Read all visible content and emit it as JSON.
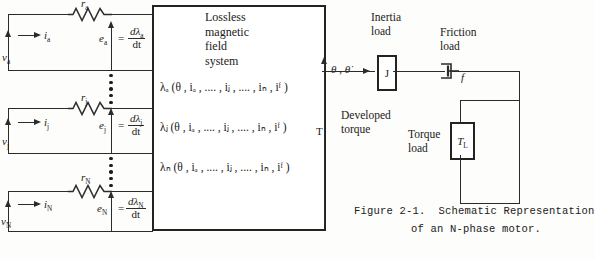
{
  "figure": {
    "caption_line1": "Figure 2-1.  Schematic Representation",
    "caption_line2": "of an N-phase motor."
  },
  "main_block": {
    "title_lines": [
      "Lossless",
      "magnetic",
      "field",
      "system"
    ],
    "equations": [
      "λₐ (θ , iₐ , .... , iⱼ , .... , iₙ , iᶠ )",
      "λⱼ (θ , iₐ , .... , iⱼ , .... , iₙ , iᶠ )",
      "λₙ (θ , iₐ , .... , iⱼ , .... , iₙ , iᶠ )"
    ]
  },
  "phases": [
    {
      "id": "a",
      "resistor_label": "r",
      "resistor_sub": "a",
      "current_label": "i",
      "current_sub": "a",
      "voltage_label": "v",
      "voltage_sub": "a",
      "emf_label": "e",
      "emf_sub": "a",
      "equals": "=",
      "numerator": "dλ",
      "numerator_sub": "a",
      "denominator": "dt"
    },
    {
      "id": "j",
      "resistor_label": "r",
      "resistor_sub": "j",
      "current_label": "i",
      "current_sub": "j",
      "voltage_label": "v",
      "voltage_sub": "j",
      "emf_label": "e",
      "emf_sub": "j",
      "equals": "=",
      "numerator": "dλ",
      "numerator_sub": "j",
      "denominator": "dt"
    },
    {
      "id": "N",
      "resistor_label": "r",
      "resistor_sub": "N",
      "current_label": "i",
      "current_sub": "N",
      "voltage_label": "v",
      "voltage_sub": "N",
      "emf_label": "e",
      "emf_sub": "N",
      "equals": "=",
      "numerator": "dλ",
      "numerator_sub": "N",
      "denominator": "dt"
    }
  ],
  "mechanical": {
    "theta_label": "θ , θ̇",
    "torque_symbol": "T",
    "developed_torque_line1": "Developed",
    "developed_torque_line2": "torque",
    "inertia_load_line1": "Inertia",
    "inertia_load_line2": "load",
    "inertia_symbol": "J",
    "friction_load_line1": "Friction",
    "friction_load_line2": "load",
    "friction_symbol": "f",
    "torque_load_line1": "Torque",
    "torque_load_line2": "load",
    "torque_load_symbol": "T",
    "torque_load_symbol_sub": "L"
  },
  "colors": {
    "line": "#2b2b2b",
    "box_border": "#232323",
    "text": "#1a1a1a",
    "background": "#fdfdfb"
  }
}
